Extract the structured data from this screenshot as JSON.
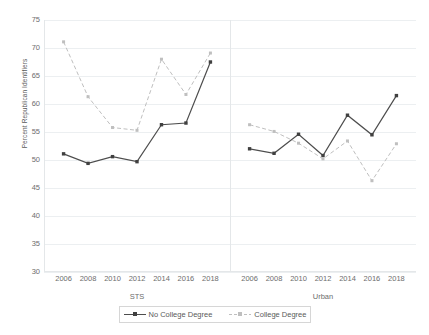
{
  "chart_data": {
    "type": "line",
    "title": "",
    "xlabel": "",
    "ylabel": "Percent Republican Identifiers",
    "ylim": [
      30,
      75
    ],
    "ytick_step": 5,
    "yticks": [
      75,
      70,
      65,
      60,
      55,
      50,
      45,
      40,
      35,
      30
    ],
    "grid": true,
    "legend_position": "bottom",
    "x": [
      2006,
      2008,
      2010,
      2012,
      2014,
      2016,
      2018
    ],
    "panels": [
      {
        "name": "STS",
        "categories": [
          2006,
          2008,
          2010,
          2012,
          2014,
          2016,
          2018
        ],
        "series": [
          {
            "name": "No College Degree",
            "values": [
              51.1,
              49.4,
              50.6,
              49.7,
              56.3,
              56.6,
              67.5
            ]
          },
          {
            "name": "College Degree",
            "values": [
              71.1,
              61.3,
              55.8,
              55.3,
              68.0,
              61.7,
              69.1
            ]
          }
        ]
      },
      {
        "name": "Urban",
        "categories": [
          2006,
          2008,
          2010,
          2012,
          2014,
          2016,
          2018
        ],
        "series": [
          {
            "name": "No College Degree",
            "values": [
              52.0,
              51.2,
              54.6,
              50.8,
              58.0,
              54.5,
              61.5
            ]
          },
          {
            "name": "College Degree",
            "values": [
              56.3,
              55.1,
              53.0,
              50.2,
              53.4,
              46.3,
              52.9
            ]
          }
        ]
      }
    ],
    "series_styles": [
      {
        "name": "No College Degree",
        "color": "#4d4d4d",
        "dash": false
      },
      {
        "name": "College Degree",
        "color": "#bfbfbf",
        "dash": true
      }
    ]
  },
  "legend": {
    "items": [
      {
        "label": "No College Degree"
      },
      {
        "label": "College Degree"
      }
    ]
  },
  "axis": {
    "y_title": "Percent Republican Identifiers"
  }
}
